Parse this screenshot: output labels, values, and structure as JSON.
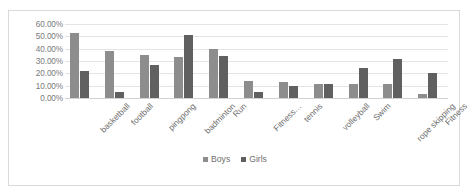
{
  "chart_data": {
    "type": "bar",
    "title": "",
    "subtitle": "",
    "xlabel": "",
    "ylabel": "",
    "ylim": [
      0,
      60
    ],
    "ytick_labels": [
      "60.00%",
      "50.00%",
      "40.00%",
      "30.00%",
      "20.00%",
      "10.00%",
      "0.00%"
    ],
    "ytick_values": [
      60,
      50,
      40,
      30,
      20,
      10,
      0
    ],
    "grid": true,
    "legend_position": "bottom",
    "categories": [
      "basketball",
      "football",
      "pingpong",
      "badminton",
      "Run",
      "Fitness…",
      "tennis",
      "volleyball",
      "Swim",
      "rope skipping",
      "Fitness"
    ],
    "series": [
      {
        "name": "Boys",
        "color": "#8d8d8d",
        "values": [
          53,
          38.5,
          34.5,
          33,
          40,
          14,
          13,
          11.5,
          11.5,
          11,
          3.5
        ]
      },
      {
        "name": "Girls",
        "color": "#606060",
        "values": [
          21.5,
          5,
          26.5,
          51,
          34,
          4.5,
          10,
          11.5,
          24.5,
          31.5,
          20.5
        ]
      }
    ]
  },
  "legend": {
    "items": [
      {
        "label": "Boys"
      },
      {
        "label": "Girls"
      }
    ]
  }
}
